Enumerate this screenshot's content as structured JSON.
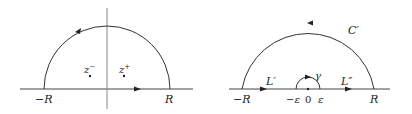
{
  "left_diagram": {
    "labels": {
      "neg_R": "−R",
      "pos_R": "R",
      "z_minus": "z",
      "z_minus_sup": "−",
      "z_plus": "z",
      "z_plus_sup": "+"
    }
  },
  "right_diagram": {
    "labels": {
      "neg_R": "−R",
      "pos_R": "R",
      "C_prime": "C′",
      "L_prime": "L′",
      "L_double_prime": "L″",
      "gamma": "γ",
      "neg_eps": "−ε",
      "zero": "0",
      "eps": "ε"
    }
  },
  "colors": {
    "stroke": "#333333",
    "axis": "#888888"
  }
}
